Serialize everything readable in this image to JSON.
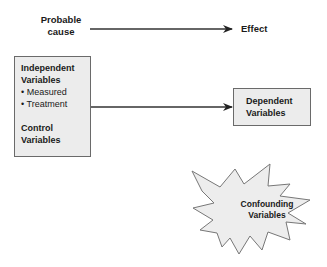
{
  "diagram": {
    "top_row": {
      "cause_label": "Probable cause",
      "cause_line1": "Probable",
      "cause_line2": "cause",
      "effect_label": "Effect"
    },
    "independent_box": {
      "title_line1": "Independent",
      "title_line2": "Variables",
      "bullets": [
        "• Measured",
        "• Treatment"
      ],
      "control_line1": "Control",
      "control_line2": "Variables"
    },
    "dependent_box": {
      "line1": "Dependent",
      "line2": "Variables"
    },
    "confounding": {
      "line1": "Confounding",
      "line2": "Variables"
    },
    "colors": {
      "box_fill": "#ececec",
      "box_border": "#6a6a6a",
      "arrow": "#333333",
      "starburst_fill": "#ededed",
      "starburst_stroke": "#777777"
    }
  }
}
